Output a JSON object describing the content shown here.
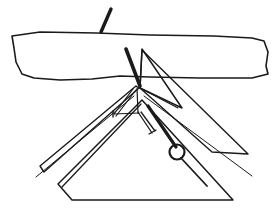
{
  "figure": {
    "domain": "line-art-illustration",
    "canvas": {
      "width": 274,
      "height": 209,
      "background": "#ffffff"
    },
    "palette": {
      "paper_white": "#ffffff",
      "fill_gray": "#a8a8a8",
      "ink_black": "#1a1a1a",
      "sail_white": "#fdfdfd"
    },
    "parts": [
      {
        "id": "horizon-band",
        "label": "Horizon band",
        "fill": "#a8a8a8",
        "stroke": "#1a1a1a",
        "stroke_width": 1.6,
        "path": "M 12,36 L 40,32 L 96,33 L 150,35 L 214,36 L 252,38 L 264,41 L 268,52 L 266,66 L 268,74 L 252,78 L 200,78 L 150,77 L 120,76 L 92,79 L 60,80 L 34,78 L 22,74 L 16,62 L 14,48 Z"
      },
      {
        "id": "masthead-antenna",
        "label": "Mast head antenna",
        "stroke": "#1a1a1a",
        "stroke_width": 3.4,
        "path": "M 111,9 L 101,32"
      },
      {
        "id": "keel-spar",
        "label": "Keel / leading spar",
        "stroke": "#1a1a1a",
        "stroke_width": 3.6,
        "path": "M 126,49 L 140,86"
      },
      {
        "id": "right-sail",
        "label": "Right sail panel",
        "fill": "#fdfdfd",
        "stroke": "#1a1a1a",
        "stroke_width": 1.5,
        "path": "M 142,49 L 182,108 L 140,88 Z"
      },
      {
        "id": "right-sail-lower",
        "label": "Right sail lower panel",
        "fill": "#fdfdfd",
        "stroke": "#1a1a1a",
        "stroke_width": 1.4,
        "path": "M 142,50 L 248,154 L 212,152 L 140,88 Z"
      },
      {
        "id": "left-sail",
        "label": "Left sail panel",
        "fill": "#fdfdfd",
        "stroke": "#1a1a1a",
        "stroke_width": 1.4,
        "path": "M 139,88 L 44,172 L 40,166 L 136,86 Z"
      },
      {
        "id": "lower-gray-wing",
        "label": "Lower gray wing surface",
        "fill": "#a8a8a8",
        "stroke": "#1a1a1a",
        "stroke_width": 1.5,
        "path": "M 142,100 L 233,200 L 72,200 L 58,184 Z"
      },
      {
        "id": "gray-wing-crease",
        "label": "Gray wing crease line",
        "stroke": "#1a1a1a",
        "stroke_width": 1.3,
        "path": "M 141,104 L 62,187"
      },
      {
        "id": "left-rigging-wire",
        "label": "Left rigging wire",
        "stroke": "#1a1a1a",
        "stroke_width": 1.0,
        "path": "M 134,96 L 36,177"
      },
      {
        "id": "right-rigging-wire",
        "label": "Right rigging wire",
        "stroke": "#1a1a1a",
        "stroke_width": 1.0,
        "path": "M 144,96 L 252,176"
      },
      {
        "id": "control-frame-upright",
        "label": "Control frame upright",
        "stroke": "#1a1a1a",
        "stroke_width": 1.2,
        "path": "M 137,88 L 138,113"
      },
      {
        "id": "control-frame-strut-a",
        "label": "Control frame diagonal strut",
        "stroke": "#1a1a1a",
        "stroke_width": 1.2,
        "path": "M 133,89 L 114,114"
      },
      {
        "id": "control-frame-strut-b",
        "label": "Control frame lower strut",
        "stroke": "#1a1a1a",
        "stroke_width": 1.2,
        "path": "M 136,90 L 116,116"
      },
      {
        "id": "control-frame-base",
        "label": "Control frame base bar",
        "stroke": "#1a1a1a",
        "stroke_width": 1.2,
        "path": "M 114,114 L 139,113"
      },
      {
        "id": "control-frame-foot",
        "label": "Control frame foot tick",
        "stroke": "#1a1a1a",
        "stroke_width": 1.4,
        "path": "M 113,111 L 113,117"
      },
      {
        "id": "kingpost-strut",
        "label": "Kingpost strut",
        "stroke": "#1a1a1a",
        "stroke_width": 3.2,
        "path": "M 148,106 L 176,147"
      },
      {
        "id": "hang-strap",
        "label": "Hang strap",
        "stroke": "#1a1a1a",
        "stroke_width": 1.3,
        "path": "M 138,112 L 152,133"
      },
      {
        "id": "hang-strap-brace",
        "label": "Hang strap brace",
        "stroke": "#1a1a1a",
        "stroke_width": 1.3,
        "path": "M 141,112 L 155,131"
      },
      {
        "id": "strap-end-tick",
        "label": "Strap end tick",
        "stroke": "#1a1a1a",
        "stroke_width": 1.3,
        "path": "M 149,134 L 156,130"
      },
      {
        "id": "pulley-ring",
        "label": "Pulley ring",
        "shape": "circle",
        "cx": 177,
        "cy": 152,
        "r": 7.5,
        "fill": "none",
        "stroke": "#1a1a1a",
        "stroke_width": 2.2
      },
      {
        "id": "tow-line",
        "label": "Tow line below ring",
        "stroke": "#1a1a1a",
        "stroke_width": 1.8,
        "path": "M 181,158 L 207,186"
      },
      {
        "id": "keel-shadow-line",
        "label": "Keel shadow line",
        "stroke": "#1a1a1a",
        "stroke_width": 1.1,
        "path": "M 140,88 L 178,108"
      }
    ]
  }
}
